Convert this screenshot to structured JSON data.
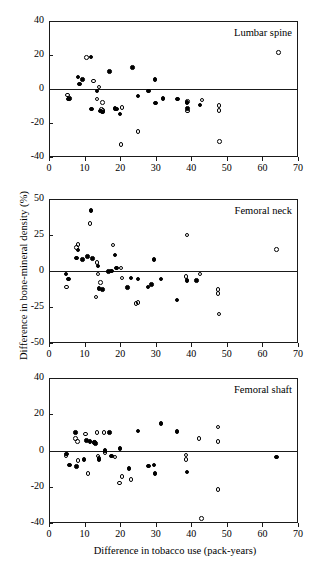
{
  "figure": {
    "ylabel": "Difference in bone-mineral density (%)",
    "xlabel": "Difference in tobacco use (pack-years)"
  },
  "chart_data": [
    {
      "type": "scatter",
      "title": "Lumbar spine",
      "xlabel": "Difference in tobacco use (pack-years)",
      "ylabel": "Difference in bone-mineral density (%)",
      "xlim": [
        0,
        70
      ],
      "ylim": [
        -40,
        40
      ],
      "xticks": [
        0,
        10,
        20,
        30,
        40,
        50,
        60,
        70
      ],
      "yticks": [
        -40,
        -20,
        0,
        20,
        40
      ],
      "grid": false,
      "legend": "none",
      "zero_reference_line": 0,
      "series": [
        {
          "name": "filled-circle",
          "marker": "filled",
          "points": [
            [
              5.5,
              -6.0
            ],
            [
              5.8,
              -5.5
            ],
            [
              8.2,
              7.0
            ],
            [
              8.5,
              3.0
            ],
            [
              9.5,
              5.5
            ],
            [
              11.8,
              18.8
            ],
            [
              12.0,
              -11.8
            ],
            [
              13.5,
              -1.2
            ],
            [
              14.5,
              -13.0
            ],
            [
              15.0,
              -13.5
            ],
            [
              17.0,
              10.2
            ],
            [
              18.5,
              -11.5
            ],
            [
              19.0,
              -11.8
            ],
            [
              20.0,
              -14.8
            ],
            [
              23.5,
              12.5
            ],
            [
              25.0,
              -4.2
            ],
            [
              28.0,
              -1.2
            ],
            [
              29.8,
              5.5
            ],
            [
              30.0,
              -8.2
            ],
            [
              32.0,
              -5.5
            ],
            [
              36.2,
              -6.0
            ],
            [
              38.8,
              -8.0
            ],
            [
              39.0,
              -11.5
            ],
            [
              42.5,
              -9.5
            ]
          ]
        },
        {
          "name": "open-circle",
          "marker": "open",
          "points": [
            [
              5.2,
              -3.5
            ],
            [
              10.5,
              18.5
            ],
            [
              12.5,
              4.8
            ],
            [
              14.0,
              1.2
            ],
            [
              13.5,
              -6.0
            ],
            [
              15.0,
              -8.0
            ],
            [
              14.8,
              -12.0
            ],
            [
              15.2,
              -12.8
            ],
            [
              20.5,
              -11.0
            ],
            [
              20.2,
              -32.5
            ],
            [
              25.0,
              -25.0
            ],
            [
              39.0,
              -7.5
            ],
            [
              39.0,
              -13.0
            ],
            [
              43.0,
              -6.5
            ],
            [
              47.8,
              -9.8
            ],
            [
              47.8,
              -12.5
            ],
            [
              48.0,
              -31.0
            ],
            [
              64.5,
              21.5
            ]
          ]
        }
      ]
    },
    {
      "type": "scatter",
      "title": "Femoral neck",
      "xlabel": "Difference in tobacco use (pack-years)",
      "ylabel": "Difference in bone-mineral density (%)",
      "xlim": [
        0,
        70
      ],
      "ylim": [
        -50,
        50
      ],
      "xticks": [
        0,
        10,
        20,
        30,
        40,
        50,
        60,
        70
      ],
      "yticks": [
        -50,
        -25,
        0,
        25,
        50
      ],
      "grid": false,
      "legend": "none",
      "zero_reference_line": 0,
      "series": [
        {
          "name": "filled-circle",
          "marker": "filled",
          "points": [
            [
              4.8,
              -2.0
            ],
            [
              5.5,
              -5.5
            ],
            [
              7.8,
              9.0
            ],
            [
              8.2,
              14.5
            ],
            [
              9.5,
              8.0
            ],
            [
              10.8,
              10.0
            ],
            [
              11.8,
              42.0
            ],
            [
              12.2,
              8.5
            ],
            [
              13.8,
              3.5
            ],
            [
              14.0,
              -12.0
            ],
            [
              15.0,
              -13.0
            ],
            [
              16.8,
              -0.5
            ],
            [
              17.5,
              0.0
            ],
            [
              18.5,
              11.0
            ],
            [
              19.0,
              2.0
            ],
            [
              22.0,
              -11.5
            ],
            [
              23.0,
              -5.0
            ],
            [
              25.0,
              -5.5
            ],
            [
              27.8,
              -11.0
            ],
            [
              28.8,
              -9.5
            ],
            [
              29.5,
              8.0
            ],
            [
              31.5,
              -5.5
            ],
            [
              36.0,
              -20.0
            ],
            [
              38.8,
              -6.5
            ],
            [
              41.5,
              -6.5
            ]
          ]
        },
        {
          "name": "open-circle",
          "marker": "open",
          "points": [
            [
              5.0,
              -11.0
            ],
            [
              7.8,
              16.5
            ],
            [
              8.2,
              18.5
            ],
            [
              11.5,
              33.0
            ],
            [
              13.5,
              6.0
            ],
            [
              13.8,
              -2.0
            ],
            [
              14.5,
              -8.0
            ],
            [
              13.2,
              -18.0
            ],
            [
              18.0,
              18.0
            ],
            [
              20.2,
              2.0
            ],
            [
              20.5,
              -5.0
            ],
            [
              24.5,
              -22.5
            ],
            [
              25.0,
              -22.0
            ],
            [
              38.8,
              25.0
            ],
            [
              38.5,
              -4.0
            ],
            [
              42.5,
              -2.0
            ],
            [
              47.5,
              -13.0
            ],
            [
              47.5,
              -15.5
            ],
            [
              47.8,
              -30.0
            ],
            [
              64.0,
              15.0
            ]
          ]
        }
      ]
    },
    {
      "type": "scatter",
      "title": "Femoral shaft",
      "xlabel": "Difference in tobacco use (pack-years)",
      "ylabel": "Difference in bone-mineral density (%)",
      "xlim": [
        0,
        70
      ],
      "ylim": [
        -40,
        40
      ],
      "xticks": [
        0,
        10,
        20,
        30,
        40,
        50,
        60,
        70
      ],
      "yticks": [
        -40,
        -20,
        0,
        20,
        40
      ],
      "grid": false,
      "legend": "none",
      "zero_reference_line": 0,
      "series": [
        {
          "name": "filled-circle",
          "marker": "filled",
          "points": [
            [
              5.0,
              -2.0
            ],
            [
              5.8,
              -8.0
            ],
            [
              7.5,
              10.0
            ],
            [
              7.8,
              -8.8
            ],
            [
              9.8,
              -5.0
            ],
            [
              10.5,
              5.5
            ],
            [
              11.5,
              5.0
            ],
            [
              12.8,
              4.5
            ],
            [
              13.0,
              4.0
            ],
            [
              14.0,
              -5.0
            ],
            [
              15.8,
              0.0
            ],
            [
              17.0,
              9.8
            ],
            [
              17.5,
              -3.0
            ],
            [
              20.0,
              1.0
            ],
            [
              22.5,
              -10.0
            ],
            [
              25.0,
              10.8
            ],
            [
              28.0,
              -8.5
            ],
            [
              29.5,
              -8.0
            ],
            [
              29.8,
              -12.8
            ],
            [
              31.5,
              15.0
            ],
            [
              36.0,
              10.5
            ],
            [
              38.8,
              -11.8
            ],
            [
              64.0,
              -3.5
            ]
          ]
        },
        {
          "name": "open-circle",
          "marker": "open",
          "points": [
            [
              4.8,
              -3.0
            ],
            [
              7.5,
              6.5
            ],
            [
              8.0,
              5.0
            ],
            [
              8.2,
              -5.5
            ],
            [
              10.2,
              9.0
            ],
            [
              11.0,
              -12.8
            ],
            [
              12.8,
              4.5
            ],
            [
              13.5,
              9.8
            ],
            [
              13.8,
              -3.0
            ],
            [
              14.0,
              -4.5
            ],
            [
              15.5,
              9.8
            ],
            [
              15.8,
              -1.0
            ],
            [
              18.5,
              -3.5
            ],
            [
              19.8,
              -18.0
            ],
            [
              20.5,
              -14.5
            ],
            [
              23.0,
              -16.0
            ],
            [
              38.5,
              -2.5
            ],
            [
              38.5,
              -5.0
            ],
            [
              42.2,
              6.5
            ],
            [
              42.8,
              -37.5
            ],
            [
              47.5,
              13.0
            ],
            [
              47.5,
              5.0
            ],
            [
              47.5,
              -21.5
            ]
          ]
        }
      ]
    }
  ],
  "panels": [
    {
      "title": "Lumbar spine",
      "ytick_labels": [
        "40",
        "20",
        "0",
        "-20",
        "-40"
      ],
      "xtick_labels": [
        "0",
        "10",
        "20",
        "30",
        "40",
        "50",
        "60",
        "70"
      ]
    },
    {
      "title": "Femoral neck",
      "ytick_labels": [
        "50",
        "25",
        "0",
        "-25",
        "-50"
      ],
      "xtick_labels": [
        "0",
        "10",
        "20",
        "30",
        "40",
        "50",
        "60",
        "70"
      ]
    },
    {
      "title": "Femoral shaft",
      "ytick_labels": [
        "40",
        "20",
        "0",
        "-20",
        "-40"
      ],
      "xtick_labels": [
        "0",
        "10",
        "20",
        "30",
        "40",
        "50",
        "60",
        "70"
      ]
    }
  ]
}
